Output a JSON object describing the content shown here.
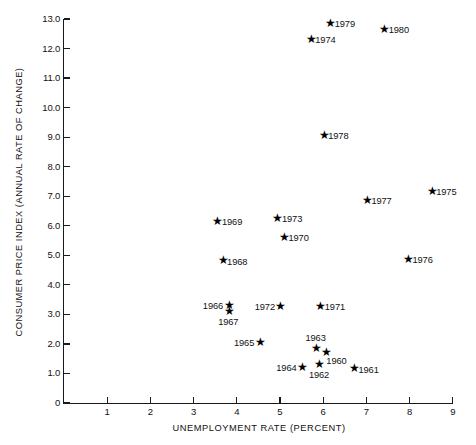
{
  "chart_data": {
    "type": "scatter",
    "title": "",
    "xlabel": "UNEMPLOYMENT RATE (PERCENT)",
    "ylabel": "CONSUMER PRICE INDEX (ANNUAL RATE OF CHANGE)",
    "xlim": [
      0,
      9
    ],
    "ylim": [
      0,
      13.0
    ],
    "grid": false,
    "legend": "none",
    "marker": "star",
    "marker_color": "#000000",
    "x_ticks": [
      "1",
      "2",
      "3",
      "4",
      "5",
      "6",
      "7",
      "8",
      "9"
    ],
    "y_ticks": [
      "0",
      "1.0",
      "2.0",
      "3.0",
      "4.0",
      "5.0",
      "6.0",
      "7.0",
      "8.0",
      "9.0",
      "10.0",
      "11.0",
      "12.0",
      "13.0"
    ],
    "x_tick_values": [
      1,
      2,
      3,
      4,
      5,
      6,
      7,
      8,
      9
    ],
    "y_tick_values": [
      0,
      1.0,
      2.0,
      3.0,
      4.0,
      5.0,
      6.0,
      7.0,
      8.0,
      9.0,
      10.0,
      11.0,
      12.0,
      13.0
    ],
    "points": [
      {
        "label": "1960",
        "x": 6.05,
        "y": 1.65,
        "label_pos": "below-right"
      },
      {
        "label": "1961",
        "x": 6.7,
        "y": 1.1,
        "label_pos": "right"
      },
      {
        "label": "1962",
        "x": 5.9,
        "y": 1.25,
        "label_pos": "below"
      },
      {
        "label": "1963",
        "x": 5.82,
        "y": 1.8,
        "label_pos": "above"
      },
      {
        "label": "1964",
        "x": 5.5,
        "y": 1.15,
        "label_pos": "left"
      },
      {
        "label": "1965",
        "x": 4.52,
        "y": 2.0,
        "label_pos": "left"
      },
      {
        "label": "1966",
        "x": 3.8,
        "y": 3.25,
        "label_pos": "left"
      },
      {
        "label": "1967",
        "x": 3.8,
        "y": 3.05,
        "label_pos": "below"
      },
      {
        "label": "1968",
        "x": 3.66,
        "y": 4.75,
        "label_pos": "right"
      },
      {
        "label": "1969",
        "x": 3.54,
        "y": 6.1,
        "label_pos": "right"
      },
      {
        "label": "1970",
        "x": 5.08,
        "y": 5.55,
        "label_pos": "right"
      },
      {
        "label": "1971",
        "x": 5.92,
        "y": 3.2,
        "label_pos": "right"
      },
      {
        "label": "1972",
        "x": 5.0,
        "y": 3.2,
        "label_pos": "left"
      },
      {
        "label": "1973",
        "x": 4.93,
        "y": 6.18,
        "label_pos": "right"
      },
      {
        "label": "1974",
        "x": 5.7,
        "y": 12.25,
        "label_pos": "right"
      },
      {
        "label": "1975",
        "x": 8.5,
        "y": 7.1,
        "label_pos": "right"
      },
      {
        "label": "1976",
        "x": 7.95,
        "y": 4.8,
        "label_pos": "right"
      },
      {
        "label": "1977",
        "x": 7.0,
        "y": 6.8,
        "label_pos": "right"
      },
      {
        "label": "1978",
        "x": 6.0,
        "y": 9.0,
        "label_pos": "right"
      },
      {
        "label": "1979",
        "x": 6.15,
        "y": 12.8,
        "label_pos": "right"
      },
      {
        "label": "1980",
        "x": 7.4,
        "y": 12.6,
        "label_pos": "right"
      }
    ]
  }
}
